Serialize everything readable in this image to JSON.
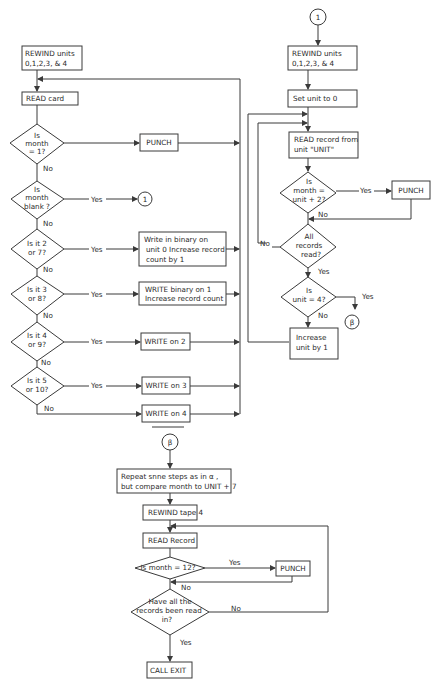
{
  "flowchart": {
    "left": {
      "rewind": [
        "REWIND  units",
        "0,1,2,3, & 4"
      ],
      "read_card": "READ card",
      "d_month1": [
        "Is",
        "month",
        "= 1?"
      ],
      "punch": "PUNCH",
      "d_blank": [
        "Is",
        "month",
        "blank ?"
      ],
      "connector_1": "1",
      "d_2or7": [
        "Is it 2",
        "or 7?"
      ],
      "write_bin0": [
        "Write in binary on",
        "unit 0 Increase record",
        "count by 1"
      ],
      "d_3or8": [
        "Is it 3",
        "or 8?"
      ],
      "write_bin1": [
        "WRITE binary on 1",
        "Increase record count"
      ],
      "d_4or9": [
        "Is it 4",
        "or 9?"
      ],
      "write2": "WRITE on 2",
      "d_5or10": [
        "Is it 5",
        "or 10?"
      ],
      "write3": "WRITE on 3",
      "write4": "WRITE on 4"
    },
    "right": {
      "connector_1": "1",
      "rewind": [
        "REWIND units",
        "0,1,2,3, & 4"
      ],
      "set_unit": "Set unit to 0",
      "read_record": [
        "READ record from",
        "unit \"UNIT\""
      ],
      "d_unit2": [
        "Is",
        "month =",
        "unit + 2?"
      ],
      "punch": "PUNCH",
      "d_all": [
        "All",
        "records",
        "read?"
      ],
      "d_unit4": [
        "Is",
        "unit = 4?"
      ],
      "connector_beta": "β",
      "increase": [
        "Increase",
        "unit by 1"
      ]
    },
    "bottom": {
      "connector_beta": "β",
      "repeat": [
        "Repeat snne steps as in α ,",
        "but compare month to UNIT + 7"
      ],
      "rewind4": "REWIND tape 4",
      "read_record": "READ Record",
      "d_month12": "Is month = 12?",
      "punch": "PUNCH",
      "d_allread": [
        "Have all the",
        "records been read",
        "in?"
      ],
      "call_exit": "CALL EXIT"
    },
    "labels": {
      "yes": "Yes",
      "no": "No"
    }
  }
}
